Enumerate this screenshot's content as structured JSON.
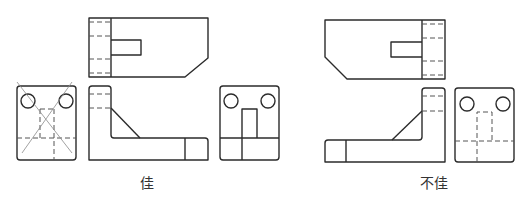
{
  "figure": {
    "line_color": "#2b2b2b",
    "hidden_line_color": "#555555",
    "cross_out_color": "#8a8a8a"
  },
  "left_group": {
    "caption": "佳",
    "views": [
      "top-view",
      "left-side-view (crossed out)",
      "front-view",
      "right-side-view"
    ]
  },
  "right_group": {
    "caption": "不佳",
    "views": [
      "top-view",
      "front-view",
      "right-side-view"
    ]
  }
}
